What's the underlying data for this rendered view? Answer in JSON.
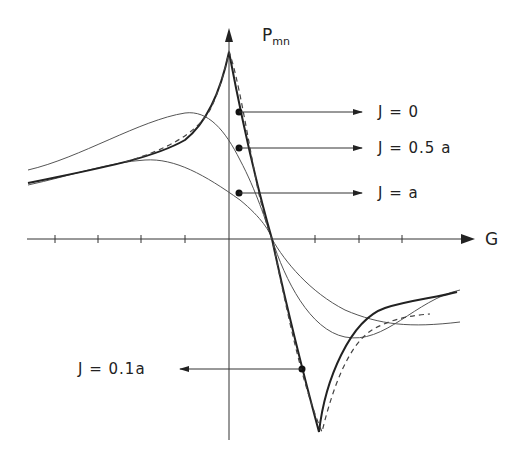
{
  "axes": {
    "y_label_main": "P",
    "y_label_sub": "mn",
    "x_label": "G"
  },
  "labels": [
    {
      "text": "J = 0"
    },
    {
      "text": "J = 0.5 a"
    },
    {
      "text": "J = a"
    },
    {
      "text": "J = 0.1a"
    }
  ],
  "legend": {
    "j0": {
      "text": "J = 0",
      "style": "dashed"
    },
    "j01": {
      "text": "J = 0.1a",
      "style": "bold solid"
    },
    "j05": {
      "text": "J = 0.5 a",
      "style": "thin solid (medium peak)"
    },
    "ja": {
      "text": "J = a",
      "style": "thin solid (broad)"
    }
  },
  "colors": {
    "ink": "#222222",
    "background": "#ffffff"
  }
}
